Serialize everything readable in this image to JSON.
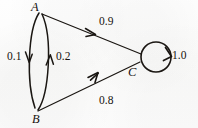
{
  "diagram": {
    "type": "markov-chain",
    "stroke_color": "#1a1612",
    "background_color": "#fdfdfc",
    "nodes": [
      {
        "id": "A",
        "label": "A",
        "x": 39,
        "y": 13
      },
      {
        "id": "B",
        "label": "B",
        "x": 38,
        "y": 110
      },
      {
        "id": "C",
        "label": "C",
        "x": 141,
        "y": 57
      }
    ],
    "edges": [
      {
        "id": "A-B",
        "from": "A",
        "to": "B",
        "weight": "0.1",
        "shape": "left-arc",
        "direction": "down"
      },
      {
        "id": "B-A",
        "from": "B",
        "to": "A",
        "weight": "0.2",
        "shape": "right-arc",
        "direction": "up"
      },
      {
        "id": "A-C",
        "from": "A",
        "to": "C",
        "weight": "0.9",
        "shape": "line",
        "direction": "right-down"
      },
      {
        "id": "B-C",
        "from": "B",
        "to": "C",
        "weight": "0.8",
        "shape": "line",
        "direction": "right-up"
      },
      {
        "id": "C-C",
        "from": "C",
        "to": "C",
        "weight": "1.0",
        "shape": "self-loop",
        "direction": "clockwise"
      }
    ]
  },
  "labels": {
    "node_a": "A",
    "node_b": "B",
    "node_c": "C",
    "weight_ab": "0.1",
    "weight_ba": "0.2",
    "weight_ac": "0.9",
    "weight_bc": "0.8",
    "weight_cc": "1.0"
  }
}
